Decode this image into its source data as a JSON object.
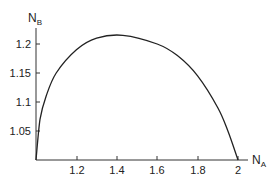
{
  "chart_data": {
    "type": "line",
    "title": "",
    "xlabel": "N_A",
    "ylabel": "N_B",
    "xlabel_main": "N",
    "xlabel_sub": "A",
    "ylabel_main": "N",
    "ylabel_sub": "B",
    "xlim": [
      1.0,
      2.0
    ],
    "ylim": [
      1.0,
      1.23
    ],
    "x_ticks": [
      "1.2",
      "1.4",
      "1.6",
      "1.8",
      "2"
    ],
    "y_ticks": [
      "1.05",
      "1.1",
      "1.15",
      "1.2"
    ],
    "grid": false,
    "legend": null,
    "series": [
      {
        "name": "N_B vs N_A",
        "color": "#222222",
        "x": [
          1.0,
          1.02,
          1.05,
          1.1,
          1.2,
          1.3,
          1.43,
          1.6,
          1.7,
          1.8,
          1.9,
          1.95,
          2.0
        ],
        "y": [
          1.0,
          1.07,
          1.11,
          1.15,
          1.19,
          1.21,
          1.215,
          1.2,
          1.18,
          1.145,
          1.09,
          1.05,
          1.0
        ]
      }
    ]
  }
}
